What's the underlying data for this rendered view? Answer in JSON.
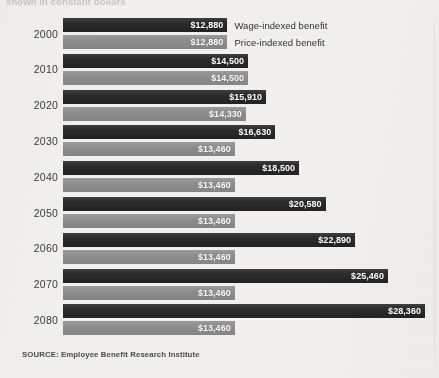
{
  "headline": {
    "text": "shown in constant dollars"
  },
  "source": {
    "label": "SOURCE: Employee Benefit Research Institute"
  },
  "legend": {
    "wage_label": "Wage-indexed benefit",
    "price_label": "Price-indexed benefit"
  },
  "colors": {
    "wage_bar": "#2b2b2b",
    "price_bar": "#8e8e8e",
    "paper": "#f1f0ee",
    "value_label_text": "#ffffff",
    "year_label_text": "#3b3b3b"
  },
  "chart_data": {
    "type": "bar",
    "orientation": "horizontal",
    "title": "shown in constant dollars",
    "xlabel": "",
    "ylabel": "",
    "grid": false,
    "legend_position": "inline-right-of-first-group",
    "categories": [
      "2000",
      "2010",
      "2020",
      "2030",
      "2040",
      "2050",
      "2060",
      "2070",
      "2080"
    ],
    "xlim": [
      0,
      28360
    ],
    "series": [
      {
        "name": "Wage-indexed benefit",
        "color": "#2b2b2b",
        "values": [
          12880,
          14500,
          15910,
          16630,
          18500,
          20580,
          22890,
          25460,
          28360
        ],
        "labels": [
          "$12,880",
          "$14,500",
          "$15,910",
          "$16,630",
          "$18,500",
          "$20,580",
          "$22,890",
          "$25,460",
          "$28,360"
        ]
      },
      {
        "name": "Price-indexed benefit",
        "color": "#8e8e8e",
        "values": [
          12880,
          14500,
          14330,
          13460,
          13460,
          13460,
          13460,
          13460,
          13460
        ],
        "labels": [
          "$12,880",
          "$14,500",
          "$14,330",
          "$13,460",
          "$13,460",
          "$13,460",
          "$13,460",
          "$13,460",
          "$13,460"
        ]
      }
    ]
  }
}
